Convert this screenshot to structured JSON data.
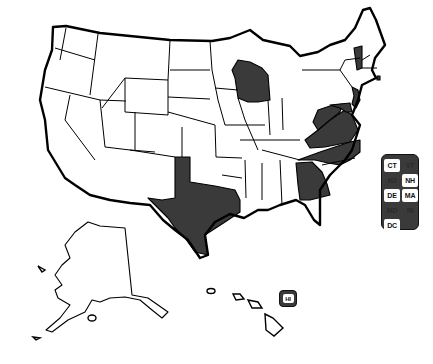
{
  "map": {
    "type": "us-states-choropleth",
    "colors": {
      "highlight": "#3a3a3a",
      "default": "#ffffff",
      "border": "#000000"
    },
    "highlighted_states": [
      "WA-none",
      "WI",
      "TX",
      "GA",
      "NC",
      "VA",
      "WV",
      "NJ",
      "MD",
      "VT",
      "RI"
    ]
  },
  "legend": {
    "small_states": [
      {
        "abbr": "CT",
        "highlighted": false
      },
      {
        "abbr": "VT",
        "highlighted": true
      },
      {
        "abbr": "NJ",
        "highlighted": true
      },
      {
        "abbr": "NH",
        "highlighted": false
      },
      {
        "abbr": "DE",
        "highlighted": false
      },
      {
        "abbr": "MA",
        "highlighted": false
      },
      {
        "abbr": "MD",
        "highlighted": true
      },
      {
        "abbr": "RI",
        "highlighted": true
      },
      {
        "abbr": "DC",
        "highlighted": false
      }
    ],
    "hawaii": {
      "abbr": "HI",
      "highlighted": false
    }
  }
}
